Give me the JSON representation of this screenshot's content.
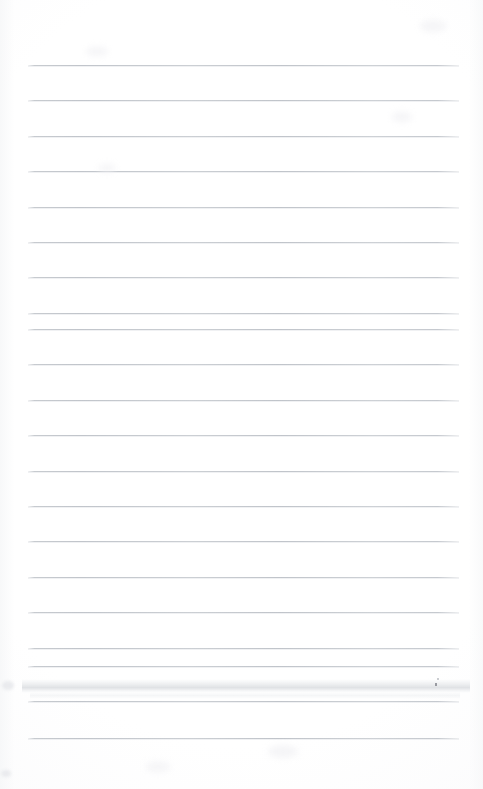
{
  "document": {
    "kind": "scanned-lined-notebook-page",
    "title": "Blank lined paper",
    "content_text": "",
    "page_width": 483,
    "page_height": 789,
    "paper_color": "#fdfdfd",
    "rule_color": "#c5c9ce",
    "rule_count": 20,
    "rule_first_y": 65,
    "rule_spacing": 35.4,
    "rule_left_x": 28,
    "rule_right_x": 459,
    "top_margin": 65,
    "bottom_margin": 51,
    "has_vertical_margin_rule": false,
    "has_handwriting": false,
    "has_printed_text": false
  },
  "rules": [
    {
      "label": "rule-1",
      "y": 65
    },
    {
      "label": "rule-2",
      "y": 100
    },
    {
      "label": "rule-3",
      "y": 136
    },
    {
      "label": "rule-4",
      "y": 171
    },
    {
      "label": "rule-5",
      "y": 207
    },
    {
      "label": "rule-6",
      "y": 242
    },
    {
      "label": "rule-7",
      "y": 277
    },
    {
      "label": "rule-8",
      "y": 313
    },
    {
      "label": "rule-9",
      "y": 329
    },
    {
      "label": "rule-10",
      "y": 364
    },
    {
      "label": "rule-11",
      "y": 400
    },
    {
      "label": "rule-12",
      "y": 435
    },
    {
      "label": "rule-13",
      "y": 471
    },
    {
      "label": "rule-14",
      "y": 506
    },
    {
      "label": "rule-15",
      "y": 541
    },
    {
      "label": "rule-16",
      "y": 577
    },
    {
      "label": "rule-17",
      "y": 612
    },
    {
      "label": "rule-18",
      "y": 648
    },
    {
      "label": "rule-19",
      "y": 666
    },
    {
      "label": "rule-20",
      "y": 701
    },
    {
      "label": "rule-21",
      "y": 738
    }
  ],
  "artifacts": {
    "smudge_band": {
      "label": "scan-smudge-band",
      "x": 22,
      "y": 679,
      "width": 448,
      "height": 14
    },
    "smudge_band_secondary": {
      "label": "scan-smudge-band-faint",
      "x": 30,
      "y": 692,
      "width": 430,
      "height": 7
    },
    "speck": {
      "label": "ink-speck",
      "x": 435,
      "y": 683,
      "width": 2,
      "height": 3
    },
    "speck_secondary": {
      "label": "ink-speck-faint",
      "x": 437,
      "y": 678,
      "width": 2,
      "height": 2
    },
    "edge_blobs": [
      {
        "label": "edge-artifact-left-top",
        "x": 2,
        "y": 681,
        "width": 12,
        "height": 9
      },
      {
        "label": "edge-artifact-left-bottom",
        "x": 1,
        "y": 770,
        "width": 10,
        "height": 7
      }
    ],
    "blotches": [
      {
        "label": "paper-blotch-1",
        "x": 86,
        "y": 47,
        "width": 22,
        "height": 9
      },
      {
        "label": "paper-blotch-2",
        "x": 420,
        "y": 20,
        "width": 26,
        "height": 12
      },
      {
        "label": "paper-blotch-3",
        "x": 392,
        "y": 112,
        "width": 20,
        "height": 10
      },
      {
        "label": "paper-blotch-4",
        "x": 98,
        "y": 164,
        "width": 18,
        "height": 8
      },
      {
        "label": "paper-blotch-5",
        "x": 268,
        "y": 745,
        "width": 30,
        "height": 13
      },
      {
        "label": "paper-blotch-6",
        "x": 146,
        "y": 762,
        "width": 24,
        "height": 10
      }
    ]
  }
}
